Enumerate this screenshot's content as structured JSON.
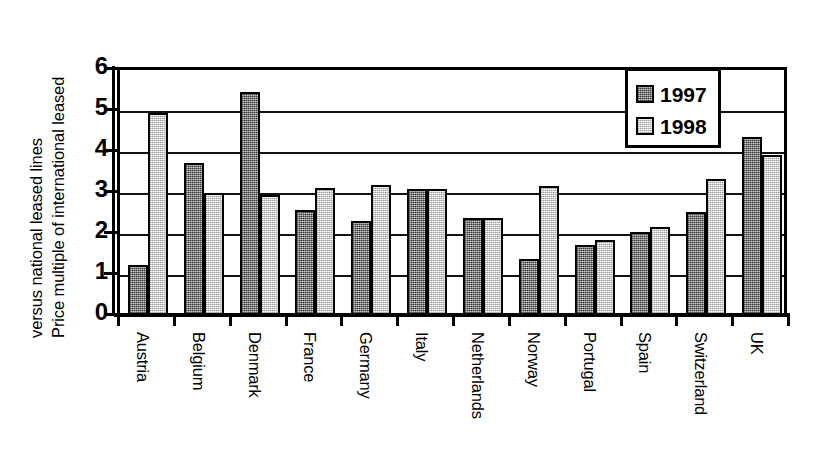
{
  "chart_data": {
    "type": "bar",
    "title": "",
    "xlabel": "",
    "ylabel": "Price multiple of international leased lines versus national leased lines",
    "ylabel_lines": [
      "Price multiple of international leased",
      "versus national leased lines"
    ],
    "ylim": [
      0,
      6
    ],
    "yticks": [
      0,
      1,
      2,
      3,
      4,
      5,
      6
    ],
    "ytick_labels": [
      "0",
      "1",
      "2",
      "3",
      "4",
      "5",
      "6"
    ],
    "grid": true,
    "grid_axis": "y",
    "legend_position": "top-right",
    "categories": [
      "Austria",
      "Belgium",
      "Denmark",
      "France",
      "Germany",
      "Italy",
      "Netherlands",
      "Norway",
      "Portugal",
      "Spain",
      "Switzerland",
      "UK"
    ],
    "series": [
      {
        "name": "1997",
        "color": "#807f7f",
        "values": [
          1.2,
          3.67,
          5.4,
          2.55,
          2.27,
          3.05,
          2.35,
          1.35,
          1.7,
          2.0,
          2.5,
          4.3
        ]
      },
      {
        "name": "1998",
        "color": "#e2e2e2",
        "values": [
          4.9,
          2.95,
          2.9,
          3.08,
          3.15,
          3.05,
          2.35,
          3.13,
          1.82,
          2.12,
          3.3,
          3.88
        ]
      }
    ]
  },
  "legend": {
    "entries": [
      {
        "label": "1997",
        "swatch": "dark-hatch-swatch"
      },
      {
        "label": "1998",
        "swatch": "light-hatch-swatch"
      }
    ]
  }
}
